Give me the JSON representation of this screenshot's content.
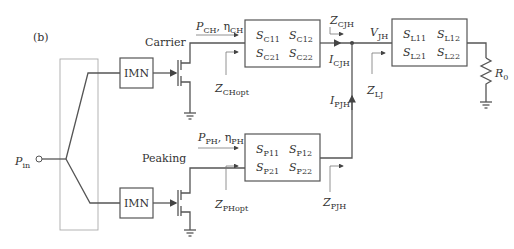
{
  "figure_label": "(b)",
  "input": {
    "symbol": "P",
    "sub": "in"
  },
  "branches": {
    "carrier": {
      "name": "Carrier",
      "imn_label": "IMN",
      "power_label": {
        "p": "P",
        "p_sub": "CH",
        "eta": "η",
        "eta_sub": "CH"
      },
      "zopt": {
        "sym": "Z",
        "sub": "CHopt"
      },
      "sparams": [
        {
          "sym": "S",
          "sub": "C11"
        },
        {
          "sym": "S",
          "sub": "C12"
        },
        {
          "sym": "S",
          "sub": "C21"
        },
        {
          "sym": "S",
          "sub": "C22"
        }
      ],
      "z_out": {
        "sym": "Z",
        "sub": "CJH"
      },
      "i_out": {
        "sym": "I",
        "sub": "CJH"
      }
    },
    "peaking": {
      "name": "Peaking",
      "imn_label": "IMN",
      "power_label": {
        "p": "P",
        "p_sub": "PH",
        "eta": "η",
        "eta_sub": "PH"
      },
      "zopt": {
        "sym": "Z",
        "sub": "PHopt"
      },
      "sparams": [
        {
          "sym": "S",
          "sub": "P11"
        },
        {
          "sym": "S",
          "sub": "P12"
        },
        {
          "sym": "S",
          "sub": "P21"
        },
        {
          "sym": "S",
          "sub": "P22"
        }
      ],
      "z_out": {
        "sym": "Z",
        "sub": "PJH"
      },
      "i_out": {
        "sym": "I",
        "sub": "PJH"
      }
    }
  },
  "junction": {
    "voltage": {
      "sym": "V",
      "sub": "JH"
    },
    "z_load": {
      "sym": "Z",
      "sub": "LJ"
    }
  },
  "load_network": {
    "sparams": [
      {
        "sym": "S",
        "sub": "L11"
      },
      {
        "sym": "S",
        "sub": "L12"
      },
      {
        "sym": "S",
        "sub": "L21"
      },
      {
        "sym": "S",
        "sub": "L22"
      }
    ]
  },
  "load_resistor": {
    "sym": "R",
    "sub": "0"
  }
}
